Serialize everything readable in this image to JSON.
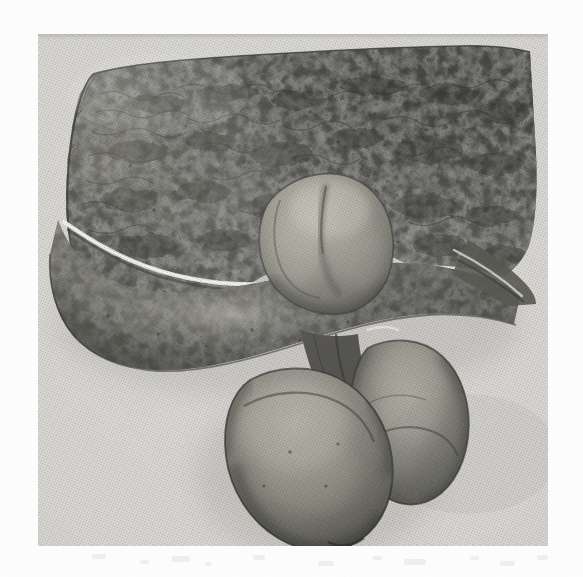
{
  "document": {
    "kind": "scanned-illustration-plate",
    "medium": "monochrome halftone print / lithograph",
    "caption": "",
    "has_text": false,
    "page_background": "#fdfdfd",
    "plate_background": "#dedcd8",
    "plate_rect": {
      "x": 38,
      "y": 34,
      "width": 510,
      "height": 512
    }
  },
  "palette": {
    "paper_white": "#fdfdfd",
    "plate_paper": "#dedcd8",
    "paper_shade": "#d2d0cb",
    "tissue_darkest": "#3c3c3a",
    "tissue_dark": "#4e4e4b",
    "tissue_mid": "#67675f",
    "tissue_light": "#8e8d84",
    "tissue_pale": "#b4b2a8",
    "highlight_line": "#f2f0ea",
    "outline_ink": "#2e2e2c"
  },
  "subject": {
    "title": "Dissected visceral specimen",
    "parts": [
      {
        "id": "upper-mass",
        "name": "upper textured tissue mass",
        "description": "large dark stippled sheet of tissue occupying the upper two thirds of the plate, mottled reticular surface markings",
        "tone": "#4e4e4b"
      },
      {
        "id": "rolled-border",
        "name": "rolled lower border",
        "description": "thick rounded band sweeping from upper left down to the right, separated from the upper mass by a bright highlight line",
        "tone": "#5a5a54"
      },
      {
        "id": "highlight-seam",
        "name": "bright seam highlight",
        "description": "narrow white highlight line tracing the fold between the upper mass and the rolled border",
        "tone": "#f2f0ea"
      },
      {
        "id": "central-protrusion",
        "name": "bulbous central protrusion",
        "description": "pale lobed swelling emerging from the face of the upper mass, right of centre",
        "tone": "#9b9a90"
      },
      {
        "id": "lower-left-lobe",
        "name": "lower left pendulous lobe",
        "description": "large rounded body suspended below the mass, pale highlight on its upper left",
        "tone": "#76756c"
      },
      {
        "id": "lower-right-lobe",
        "name": "lower right pendulous lobe",
        "description": "elongated ovoid body beside and behind the left lobe, with a pale vertical highlight",
        "tone": "#6e6d65"
      },
      {
        "id": "stalk",
        "name": "connecting stalk",
        "description": "narrow neck of tissue joining the pendulous lobes to the undersurface of the mass",
        "tone": "#4a4a46"
      }
    ]
  }
}
